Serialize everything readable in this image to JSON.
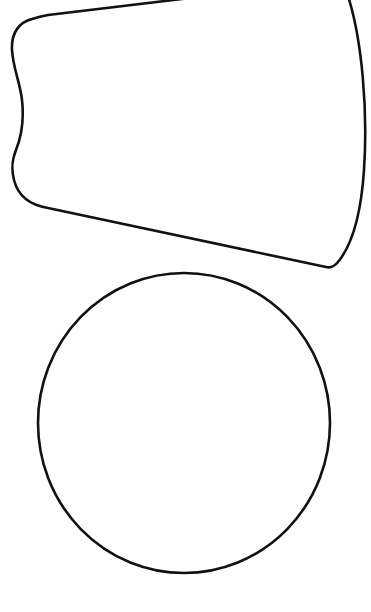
{
  "canvas": {
    "width": 371,
    "height": 612,
    "background": "#ffffff",
    "stroke_color": "#111111"
  },
  "shapes": [
    {
      "name": "tapered-shape",
      "kind": "outline",
      "description": "Wide trapezoid-like outline with curved right edge and wavy left edge"
    },
    {
      "name": "circle",
      "kind": "outline",
      "center": [
        184,
        423
      ],
      "radius_x": 146,
      "radius_y": 150
    }
  ]
}
